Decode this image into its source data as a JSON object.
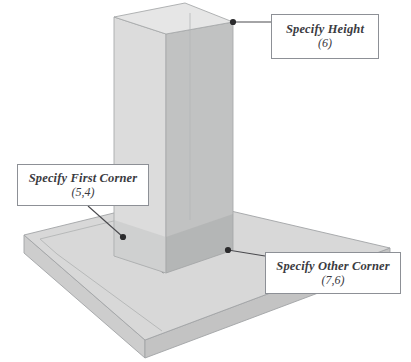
{
  "diagram": {
    "background_color": "#ffffff"
  },
  "callouts": [
    {
      "id": "height",
      "name": "specify-height",
      "title": "Specify Height",
      "value": "(6)",
      "anchor_label": "column-top-right-corner"
    },
    {
      "id": "first_corner",
      "name": "specify-first-corner",
      "title": "Specify First Corner",
      "value": "(5,4)",
      "anchor_label": "base-left-corner"
    },
    {
      "id": "other_corner",
      "name": "specify-other-corner",
      "title": "Specify Other Corner",
      "value": "(7,6)",
      "anchor_label": "base-right-corner"
    }
  ],
  "colors": {
    "slab_top": "#d7d7d7",
    "slab_front": "#c6c6c6",
    "slab_left": "#cfcfcf",
    "column_left": "#dcdcdc",
    "column_right": "#c0c1c1",
    "column_top": "#e4e4e4",
    "footprint_overlay": "#a9abab",
    "outline": "#9a9c9f",
    "callout_border": "#8d9096",
    "callout_background": "#ffffff",
    "text": "#3b3b3f",
    "leader_line": "#4a4a4e",
    "anchor_dot": "#2b2b2d"
  }
}
